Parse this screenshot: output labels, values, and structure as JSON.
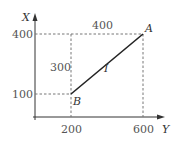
{
  "diagram": {
    "axes": {
      "vertical_label": "X",
      "horizontal_label": "Y",
      "vertical_ticks": [
        "400",
        "100"
      ],
      "horizontal_ticks": [
        "200",
        "600"
      ]
    },
    "points": {
      "A": {
        "label": "A",
        "x": 600,
        "y": 400
      },
      "B": {
        "label": "B",
        "x": 200,
        "y": 100
      }
    },
    "segment_label": "I",
    "dimension_labels": {
      "horizontal": "400",
      "vertical": "300"
    },
    "colors": {
      "line": "#222222",
      "dashed": "#777777",
      "text": "#555555"
    }
  }
}
